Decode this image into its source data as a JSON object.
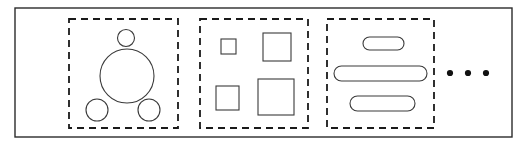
{
  "figure": {
    "title": "",
    "width": 526,
    "height": 145,
    "background_color": "#ffffff"
  },
  "outer_frame": {
    "name": "outer-container",
    "x": 15,
    "y": 8,
    "width": 497,
    "height": 129,
    "stroke_color": "#2b2b2b",
    "stroke_width": 1.4,
    "fill": "none"
  },
  "groups": [
    {
      "name": "circle-group",
      "label": "",
      "box": {
        "x": 69,
        "y": 19,
        "width": 109,
        "height": 109
      },
      "box_style": {
        "stroke_color": "#1a1a1a",
        "stroke_width": 1.8,
        "dash": "7 5"
      },
      "shape_kind": "circle",
      "shapes": [
        {
          "name": "circle-small-top",
          "cx": 126,
          "cy": 38,
          "r": 8.5
        },
        {
          "name": "circle-large-center",
          "cx": 127,
          "cy": 76,
          "r": 27
        },
        {
          "name": "circle-small-bottom-left",
          "cx": 97,
          "cy": 110,
          "r": 11
        },
        {
          "name": "circle-small-bottom-right",
          "cx": 149,
          "cy": 110,
          "r": 11
        }
      ]
    },
    {
      "name": "square-group",
      "label": "",
      "box": {
        "x": 200,
        "y": 19,
        "width": 108,
        "height": 109
      },
      "box_style": {
        "stroke_color": "#1a1a1a",
        "stroke_width": 1.8,
        "dash": "7 5"
      },
      "shape_kind": "square",
      "shapes": [
        {
          "name": "square-small",
          "x": 221,
          "y": 39,
          "width": 15,
          "height": 15
        },
        {
          "name": "square-medium-large",
          "x": 263,
          "y": 33,
          "width": 28,
          "height": 28
        },
        {
          "name": "square-medium",
          "x": 216,
          "y": 86,
          "width": 23,
          "height": 24
        },
        {
          "name": "square-large",
          "x": 258,
          "y": 79,
          "width": 36,
          "height": 36
        }
      ]
    },
    {
      "name": "pill-group",
      "label": "",
      "box": {
        "x": 327,
        "y": 19,
        "width": 107,
        "height": 109
      },
      "box_style": {
        "stroke_color": "#1a1a1a",
        "stroke_width": 1.8,
        "dash": "7 5"
      },
      "shape_kind": "rounded-bar",
      "shapes": [
        {
          "name": "pill-short-top",
          "x": 363,
          "y": 37,
          "width": 41,
          "height": 13
        },
        {
          "name": "pill-long-middle",
          "x": 334,
          "y": 66,
          "width": 93,
          "height": 15
        },
        {
          "name": "pill-medium-bottom",
          "x": 350,
          "y": 96,
          "width": 65,
          "height": 15
        }
      ]
    }
  ],
  "ellipsis": {
    "name": "continuation-ellipsis",
    "text": "...",
    "dot_count": 3,
    "dots": [
      {
        "cx": 450,
        "cy": 73,
        "r": 3.1
      },
      {
        "cx": 468,
        "cy": 73,
        "r": 3.1
      },
      {
        "cx": 486,
        "cy": 73,
        "r": 3.1
      }
    ],
    "color": "#111111"
  }
}
